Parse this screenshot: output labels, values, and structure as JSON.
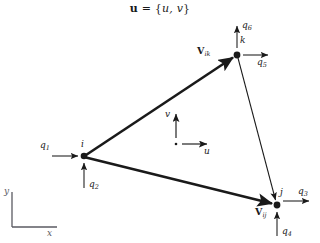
{
  "figure": {
    "title_vector": "u",
    "title_equals": " = {",
    "title_components": "u, v",
    "title_close": "}",
    "background_color": "#ffffff",
    "stroke_color": "#1a1a1a"
  },
  "nodes": [
    {
      "id": "i",
      "label": "i",
      "x": 84,
      "y": 156
    },
    {
      "id": "k",
      "label": "k",
      "x": 237,
      "y": 55
    },
    {
      "id": "j",
      "label": "j",
      "x": 277,
      "y": 205
    }
  ],
  "vectors": [
    {
      "name": "V_ik",
      "symbol": "V",
      "subscript": "ik",
      "from": "i",
      "to": "k",
      "style": "thick"
    },
    {
      "name": "V_ij",
      "symbol": "V",
      "subscript": "ij",
      "from": "i",
      "to": "j",
      "style": "thick"
    },
    {
      "name": "edge_kj",
      "symbol": "",
      "subscript": "",
      "from": "k",
      "to": "j",
      "style": "thin"
    }
  ],
  "dof_arrows": [
    {
      "label": "q",
      "subscript": "1",
      "node": "i",
      "direction": "right"
    },
    {
      "label": "q",
      "subscript": "2",
      "node": "i",
      "direction": "up"
    },
    {
      "label": "q",
      "subscript": "3",
      "node": "j",
      "direction": "right"
    },
    {
      "label": "q",
      "subscript": "4",
      "node": "j",
      "direction": "up"
    },
    {
      "label": "q",
      "subscript": "5",
      "node": "k",
      "direction": "right"
    },
    {
      "label": "q",
      "subscript": "6",
      "node": "k",
      "direction": "up"
    }
  ],
  "local_axes": {
    "origin_x": 176,
    "origin_y": 144,
    "u_label": "u",
    "v_label": "v"
  },
  "global_axes": {
    "corner_x": 12,
    "corner_y": 227,
    "x_label": "x",
    "y_label": "y"
  }
}
